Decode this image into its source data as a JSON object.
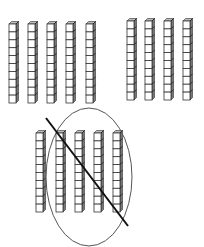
{
  "colors": {
    "stroke": "#333333",
    "cube_face": "#ffffff",
    "cube_side": "#777777",
    "cube_top": "#bbbbbb",
    "ellipse": "#555555",
    "slash": "#111111"
  },
  "rod": {
    "cubes_per_rod": 10,
    "cube_width": 7,
    "cube_height": 7.9,
    "depth": 2.5
  },
  "groups": [
    {
      "name": "group-top-left",
      "rod_count": 5,
      "rod_x": [
        9,
        28,
        47,
        66,
        86
      ],
      "top_y": 24
    },
    {
      "name": "group-top-right",
      "rod_count": 4,
      "rod_x": [
        127,
        145,
        164,
        183
      ],
      "top_y": 21
    },
    {
      "name": "group-bottom",
      "rod_count": 5,
      "rod_x": [
        36,
        56,
        75,
        94,
        113
      ],
      "top_y": 133
    }
  ],
  "annotations": {
    "ellipse": {
      "cx": 89,
      "cy": 177,
      "rx": 43,
      "ry": 69,
      "encloses_rods": 4
    },
    "slash": {
      "x1": 46,
      "y1": 118,
      "x2": 128,
      "y2": 226
    }
  }
}
